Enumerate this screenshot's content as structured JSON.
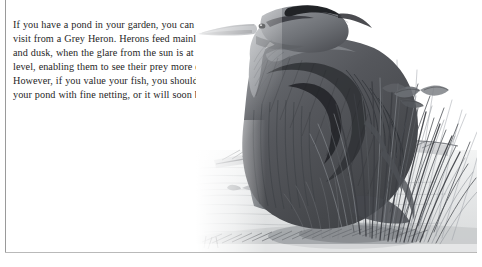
{
  "page": {
    "width": 482,
    "height": 267,
    "background_color": "#ffffff",
    "frame_rule_color": "#9a9a9a"
  },
  "text_block": {
    "paragraph": "If you have a pond in your garden, you can expect a\nvisit from a Grey Heron. Herons feed mainly at dawn\nand dusk, when the glare from the sun is at its lowest\nlevel, enabling them to see their prey more easily.\nHowever, if you value your fish, you should cover\nyour pond with fine netting, or it will soon be empty!",
    "lines": [
      "If you have a pond in your garden, you can expect a",
      "visit from a Grey Heron. Herons feed mainly at dawn",
      "and dusk, when the glare from the sun is at its lowest",
      "level, enabling them to see their prey more easily.",
      "However, if you value your fish, you should cover",
      "your pond with fine netting, or it will soon be empty!"
    ],
    "text_color": "#262626"
  },
  "illustration": {
    "subject": "grey-heron-in-reeds-by-pond",
    "medium": "pencil-drawing",
    "elements": [
      "heron-body",
      "heron-head",
      "heron-beak",
      "heron-eye",
      "reeds",
      "pond-water",
      "fish-in-water",
      "bank-grass"
    ],
    "palette": {
      "darkest": "#3f4044",
      "dark": "#5b5d62",
      "mid": "#84878c",
      "light": "#b3b6ba",
      "lightest": "#d8dadc",
      "water": "#e3e5e6",
      "paper": "#ffffff"
    }
  }
}
